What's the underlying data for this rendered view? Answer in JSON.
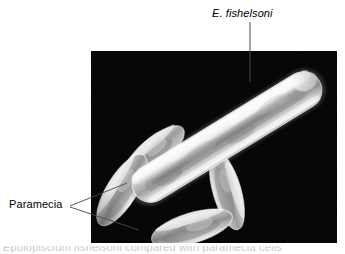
{
  "figure": {
    "kind": "photomicrograph-with-callouts",
    "background_color": "#ffffff",
    "photo": {
      "background_color": "#000000",
      "left": 91,
      "top": 51,
      "width": 246,
      "height": 192
    }
  },
  "labels": {
    "species_label": "E. fishelsoni",
    "paramecia_label": "Paramecia"
  },
  "caption": {
    "text": "Epulopiscium fishelsoni compared with paramecia cells"
  },
  "organisms": {
    "epulopiscium": {
      "name": "E. fishelsoni",
      "count": 1,
      "shape": "elongated cigar / rod",
      "fill_color": "#d8d8d8"
    },
    "paramecia": {
      "name": "Paramecia",
      "count": 4,
      "shape": "slipper / ovoid",
      "fill_color": "#b4b4b4"
    }
  },
  "colors": {
    "photo_background": "#000000",
    "page_background": "#ffffff",
    "leader_line": "#4a4a4a",
    "text": "#000000"
  }
}
